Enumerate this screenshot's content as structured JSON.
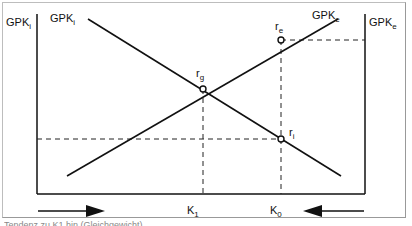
{
  "diagram": {
    "axes": {
      "left_label": {
        "main": "GPK",
        "sub": "i"
      },
      "right_label": {
        "main": "GPK",
        "sub": "e"
      }
    },
    "curves": [
      {
        "id": "gpk-i",
        "label": {
          "main": "GPK",
          "sub": "i"
        },
        "from": [
          88,
          19
        ],
        "to": [
          341,
          176
        ]
      },
      {
        "id": "gpk-e",
        "label": {
          "main": "GPK",
          "sub": "e"
        },
        "from": [
          67,
          176
        ],
        "to": [
          338,
          19
        ]
      }
    ],
    "points": [
      {
        "id": "rg",
        "label": {
          "main": "r",
          "sub": "g"
        },
        "x": 203,
        "y": 89
      },
      {
        "id": "re",
        "label": {
          "main": "r",
          "sub": "e"
        },
        "x": 281,
        "y": 40
      },
      {
        "id": "ri",
        "label": {
          "main": "r",
          "sub": "i"
        },
        "x": 281,
        "y": 139
      }
    ],
    "x_ticks": [
      {
        "id": "k1",
        "label": {
          "main": "K",
          "sub": "1"
        },
        "x": 203
      },
      {
        "id": "k0",
        "label": {
          "main": "K",
          "sub": "0"
        },
        "x": 281
      }
    ],
    "arrows": [
      {
        "id": "arrow-right",
        "direction": "right"
      },
      {
        "id": "arrow-left",
        "direction": "left"
      }
    ]
  },
  "caption": "Tendenz zu K1 hin (Gleichgewicht)"
}
